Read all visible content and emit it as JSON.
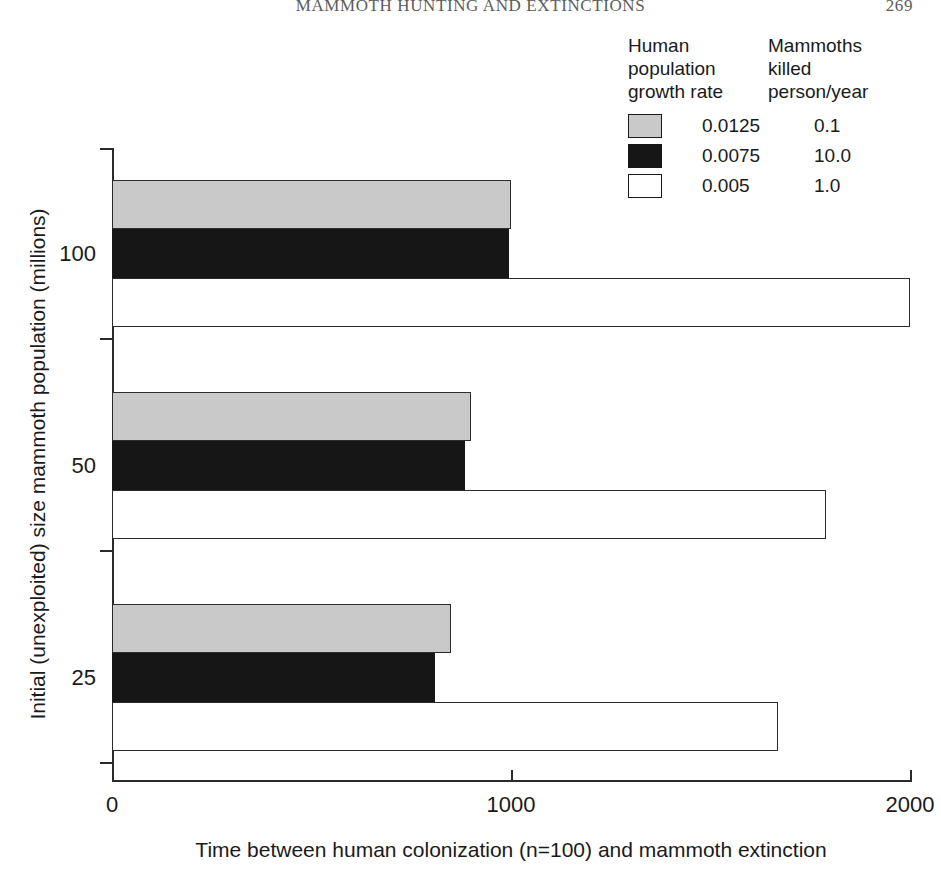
{
  "running_head": {
    "title": "MAMMOTH HUNTING AND EXTINCTIONS",
    "page_number": "269"
  },
  "legend": {
    "header_col1": [
      "Human",
      "population",
      "growth rate"
    ],
    "header_col2": [
      "Mammoths",
      "killed",
      "person/year"
    ],
    "rows": [
      {
        "swatch": "gray",
        "growth_rate": "0.0125",
        "killed": "0.1"
      },
      {
        "swatch": "black",
        "growth_rate": "0.0075",
        "killed": "10.0"
      },
      {
        "swatch": "white",
        "growth_rate": "0.005",
        "killed": "1.0"
      }
    ]
  },
  "chart_data": {
    "type": "bar",
    "orientation": "horizontal",
    "title": "",
    "xlabel": "Time between human colonization (n=100) and mammoth extinction",
    "ylabel": "Initial (unexploited) size mammoth population (millions)",
    "categories": [
      "100",
      "50",
      "25"
    ],
    "xlim": [
      0,
      2000
    ],
    "xticks": [
      0,
      1000,
      2000
    ],
    "xtick_labels": [
      "0",
      "1000",
      "2000"
    ],
    "ytick_labels": [
      "100",
      "50",
      "25"
    ],
    "grid": false,
    "legend_position": "top-right",
    "series": [
      {
        "name": "0.0125 growth rate / 0.1 killed per person/year",
        "swatch": "gray",
        "color": "#c9c9c9",
        "values": [
          1000,
          900,
          850
        ]
      },
      {
        "name": "0.0075 growth rate / 10.0 killed per person/year",
        "swatch": "black",
        "color": "#161616",
        "values": [
          995,
          885,
          810
        ]
      },
      {
        "name": "0.005 growth rate / 1.0 killed per person/year",
        "swatch": "white",
        "color": "#ffffff",
        "values": [
          2000,
          1790,
          1670
        ]
      }
    ]
  },
  "colors": {
    "gray": "#c9c9c9",
    "black": "#161616",
    "white": "#ffffff",
    "axis": "#2b2b2b"
  }
}
